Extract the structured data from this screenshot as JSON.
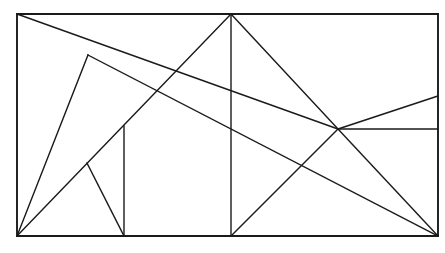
{
  "document": {
    "kind": "geometry-line-figure",
    "background_color": "#ffffff",
    "stroke_color": "#1a1a1a",
    "canvas": {
      "width": 445,
      "height": 253
    }
  },
  "figure": {
    "title": "",
    "outline": {
      "name": "rectangle-outline",
      "left": 17,
      "top": 14,
      "right": 438,
      "bottom": 236,
      "stroke_width": 1.9
    },
    "points": [
      {
        "id": "A",
        "label": "",
        "x": 17,
        "y": 14,
        "role": "rect-top-left"
      },
      {
        "id": "B",
        "label": "",
        "x": 438,
        "y": 14,
        "role": "rect-top-right"
      },
      {
        "id": "C",
        "label": "",
        "x": 438,
        "y": 236,
        "role": "rect-bottom-right"
      },
      {
        "id": "D",
        "label": "",
        "x": 17,
        "y": 236,
        "role": "rect-bottom-left"
      },
      {
        "id": "T",
        "label": "",
        "x": 231,
        "y": 14,
        "role": "top-apex"
      },
      {
        "id": "M",
        "label": "",
        "x": 231,
        "y": 236,
        "role": "bottom-mid"
      },
      {
        "id": "J",
        "label": "",
        "x": 338,
        "y": 129,
        "role": "right-junction"
      },
      {
        "id": "P",
        "label": "",
        "x": 88,
        "y": 55,
        "role": "upper-left-node"
      },
      {
        "id": "Q",
        "label": "",
        "x": 87,
        "y": 163,
        "role": "lower-left-node"
      },
      {
        "id": "V",
        "label": "",
        "x": 124,
        "y": 126,
        "role": "left-vertical-top"
      },
      {
        "id": "W",
        "label": "",
        "x": 124,
        "y": 236,
        "role": "left-vertical-foot"
      },
      {
        "id": "R",
        "label": "",
        "x": 438,
        "y": 96,
        "role": "right-edge-upper"
      },
      {
        "id": "S",
        "label": "",
        "x": 438,
        "y": 129,
        "role": "right-edge-mid"
      }
    ],
    "segments": [
      {
        "name": "rect-top-edge",
        "x1": 17,
        "y1": 14,
        "x2": 438,
        "y2": 14,
        "width": 1.9
      },
      {
        "name": "rect-right-edge",
        "x1": 438,
        "y1": 14,
        "x2": 438,
        "y2": 236,
        "width": 1.9
      },
      {
        "name": "rect-bottom-edge",
        "x1": 438,
        "y1": 236,
        "x2": 17,
        "y2": 236,
        "width": 1.9
      },
      {
        "name": "rect-left-edge",
        "x1": 17,
        "y1": 236,
        "x2": 17,
        "y2": 14,
        "width": 1.9
      },
      {
        "name": "diag-topleft-to-junction",
        "x1": 17,
        "y1": 14,
        "x2": 338,
        "y2": 129,
        "width": 1.4
      },
      {
        "name": "diag-node-P-to-corner-D",
        "x1": 88,
        "y1": 55,
        "x2": 17,
        "y2": 236,
        "width": 1.4
      },
      {
        "name": "diag-corner-D-to-apex-T",
        "x1": 17,
        "y1": 236,
        "x2": 231,
        "y2": 14,
        "width": 1.4
      },
      {
        "name": "apex-vertical",
        "x1": 231,
        "y1": 14,
        "x2": 231,
        "y2": 236,
        "width": 1.4
      },
      {
        "name": "diag-apex-T-to-junction",
        "x1": 231,
        "y1": 14,
        "x2": 338,
        "y2": 129,
        "width": 1.4
      },
      {
        "name": "diag-node-Q-to-vertical-foot",
        "x1": 87,
        "y1": 163,
        "x2": 124,
        "y2": 236,
        "width": 1.4
      },
      {
        "name": "left-vertical",
        "x1": 124,
        "y1": 126,
        "x2": 124,
        "y2": 236,
        "width": 1.4
      },
      {
        "name": "diag-bottom-mid-to-junction",
        "x1": 231,
        "y1": 236,
        "x2": 338,
        "y2": 129,
        "width": 1.4
      },
      {
        "name": "diag-junction-to-corner-C",
        "x1": 338,
        "y1": 129,
        "x2": 438,
        "y2": 236,
        "width": 1.4
      },
      {
        "name": "diag-junction-to-right-upper",
        "x1": 338,
        "y1": 129,
        "x2": 438,
        "y2": 96,
        "width": 1.4
      },
      {
        "name": "junction-horizontal-to-right",
        "x1": 338,
        "y1": 129,
        "x2": 438,
        "y2": 129,
        "width": 1.4
      },
      {
        "name": "long-diag-P-to-corner-C",
        "x1": 88,
        "y1": 55,
        "x2": 438,
        "y2": 236,
        "width": 1.4
      }
    ]
  }
}
